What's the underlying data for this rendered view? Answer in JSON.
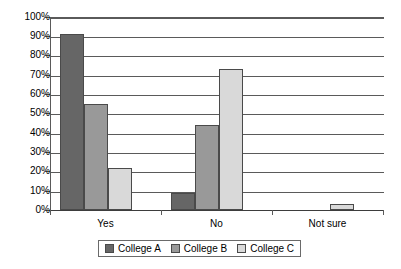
{
  "chart_data": {
    "type": "bar",
    "title": "",
    "subtitle": "",
    "xlabel": "",
    "ylabel": "",
    "categories": [
      "Yes",
      "No",
      "Not sure"
    ],
    "series": [
      {
        "name": "College A",
        "color": "#666666",
        "values": [
          91,
          9,
          0
        ]
      },
      {
        "name": "College B",
        "color": "#999999",
        "values": [
          55,
          44,
          0
        ]
      },
      {
        "name": "College C",
        "color": "#d9d9d9",
        "values": [
          22,
          73,
          3
        ]
      }
    ],
    "ylim": [
      0,
      100
    ],
    "ytick_labels": [
      "100%",
      "90%",
      "80%",
      "70%",
      "60%",
      "50%",
      "40%",
      "30%",
      "20%",
      "10%",
      "0%"
    ],
    "ytick_values": [
      100,
      90,
      80,
      70,
      60,
      50,
      40,
      30,
      20,
      10,
      0
    ],
    "grid": true,
    "grid_axis": "y",
    "legend_position": "bottom",
    "legend_entries": [
      "College A",
      "College B",
      "College C"
    ]
  }
}
